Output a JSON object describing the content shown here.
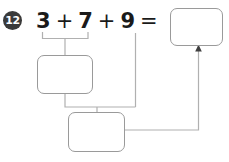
{
  "worksheet": {
    "problem_number": "12",
    "equation": {
      "terms": [
        "3",
        "7",
        "9"
      ],
      "operators": [
        "+",
        "+"
      ],
      "equals": "=",
      "full_text": "3 + 7 + 9 ="
    },
    "answer_boxes": [
      {
        "id": "box-top",
        "name": "final-answer-box",
        "value": "",
        "placeholder": ""
      },
      {
        "id": "box-mid",
        "name": "partial-sum-box-1",
        "value": "",
        "placeholder": ""
      },
      {
        "id": "box-bottom",
        "name": "partial-sum-box-2",
        "value": "",
        "placeholder": ""
      }
    ],
    "connectors": [
      {
        "name": "bracket-3-plus-7",
        "from": "terms 3 and 7",
        "to": "partial-sum-box-1"
      },
      {
        "name": "bracket-partial-plus-9",
        "from": "partial-sum-box-1 and term 9",
        "to": "partial-sum-box-2"
      },
      {
        "name": "arrow-to-final-answer",
        "from": "partial-sum-box-2",
        "to": "final-answer-box",
        "has_arrowhead": true
      }
    ],
    "colors": {
      "badge_fill": "#3a3a3a",
      "badge_text": "#ffffff",
      "text": "#1a1a1a",
      "box_border": "#9a9a9a",
      "wire": "#b0b0b0",
      "arrow": "#3f3f3f",
      "background": "#ffffff"
    }
  }
}
